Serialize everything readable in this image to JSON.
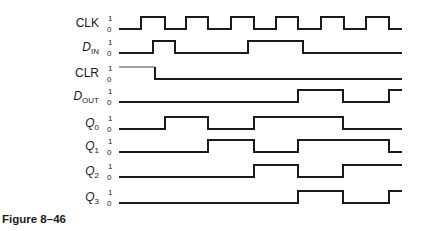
{
  "caption": "Figure 8–46",
  "level_labels": {
    "high": "1",
    "low": "0"
  },
  "time_axis": {
    "x_start": 119,
    "x_end": 402
  },
  "signals": [
    {
      "id": "clk",
      "label": "CLK",
      "subscript": "",
      "italic": false,
      "y_low": 29,
      "initial": 0,
      "edges": [
        141,
        165,
        186,
        208,
        231,
        254,
        276,
        298,
        321,
        344,
        366,
        389
      ]
    },
    {
      "id": "din",
      "label": "D",
      "subscript": "IN",
      "italic": true,
      "y_low": 53,
      "initial": 0,
      "edges": [
        153,
        175,
        248,
        303
      ]
    },
    {
      "id": "clr",
      "label": "CLR",
      "subscript": "",
      "italic": false,
      "y_low": 79,
      "initial": 1,
      "edges": [
        155
      ],
      "thin_high": true
    },
    {
      "id": "dout",
      "label": "D",
      "subscript": "OUT",
      "italic": true,
      "y_low": 102,
      "initial": 0,
      "edges": [
        298,
        343,
        389
      ]
    },
    {
      "id": "q0",
      "label": "Q",
      "subscript": "0",
      "italic": true,
      "y_low": 129,
      "initial": 0,
      "edges": [
        165,
        208,
        254,
        343
      ]
    },
    {
      "id": "q1",
      "label": "Q",
      "subscript": "1",
      "italic": true,
      "y_low": 152,
      "initial": 0,
      "edges": [
        208,
        254,
        298,
        389
      ]
    },
    {
      "id": "q2",
      "label": "Q",
      "subscript": "2",
      "italic": true,
      "y_low": 177,
      "initial": 0,
      "edges": [
        254,
        298,
        343
      ]
    },
    {
      "id": "q3",
      "label": "Q",
      "subscript": "3",
      "italic": true,
      "y_low": 203,
      "initial": 0,
      "edges": [
        298,
        343,
        389
      ]
    }
  ],
  "high_offset": 12
}
